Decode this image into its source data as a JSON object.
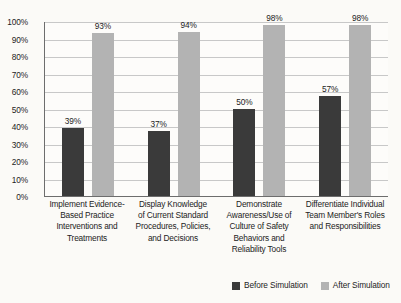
{
  "chart_data": {
    "type": "bar",
    "title": "",
    "subtitle": "",
    "xlabel": "",
    "ylabel": "",
    "ylim": [
      0,
      100
    ],
    "ytick_labels": [
      "100%",
      "90%",
      "80%",
      "70%",
      "60%",
      "50%",
      "40%",
      "30%",
      "20%",
      "10%",
      "0%"
    ],
    "ytick_values": [
      100,
      90,
      80,
      70,
      60,
      50,
      40,
      30,
      20,
      10,
      0
    ],
    "grid": "horizontal",
    "legend_position": "bottom-right",
    "categories": [
      "Implement Evidence-Based Practice Interventions and Treatments",
      "Display Knowledge of Current Standard Procedures, Policies, and Decisions",
      "Demonstrate Awareness/Use of Culture of Safety Behaviors and Reliability Tools",
      "Differentiate Individual Team Member's Roles and Responsibilities"
    ],
    "category_lines": [
      [
        "Implement Evidence-",
        "Based Practice",
        "Interventions and",
        "Treatments"
      ],
      [
        "Display Knowledge",
        "of Current Standard",
        "Procedures, Policies,",
        "and Decisions"
      ],
      [
        "Demonstrate",
        "Awareness/Use of",
        "Culture of Safety",
        "Behaviors and",
        "Reliability Tools"
      ],
      [
        "Differentiate Individual",
        "Team Member's Roles",
        "and Responsibilities"
      ]
    ],
    "series": [
      {
        "name": "Before Simulation",
        "color": "#3a3a3a",
        "values": [
          39,
          37,
          50,
          57
        ],
        "labels": [
          "39%",
          "37%",
          "50%",
          "57%"
        ]
      },
      {
        "name": "After Simulation",
        "color": "#b3b3b3",
        "values": [
          93,
          94,
          98,
          98
        ],
        "labels": [
          "93%",
          "94%",
          "98%",
          "98%"
        ]
      }
    ]
  },
  "legend": {
    "items": [
      {
        "label": "Before Simulation",
        "color": "#3a3a3a"
      },
      {
        "label": "After Simulation",
        "color": "#b3b3b3"
      }
    ]
  },
  "colors": {
    "background": "#fbfaf7",
    "plot_background": "#fdfcfa",
    "axis": "#6d6d6d",
    "gridline": "#c8c8c8",
    "text": "#232323",
    "series_before": "#3a3a3a",
    "series_after": "#b3b3b3"
  }
}
